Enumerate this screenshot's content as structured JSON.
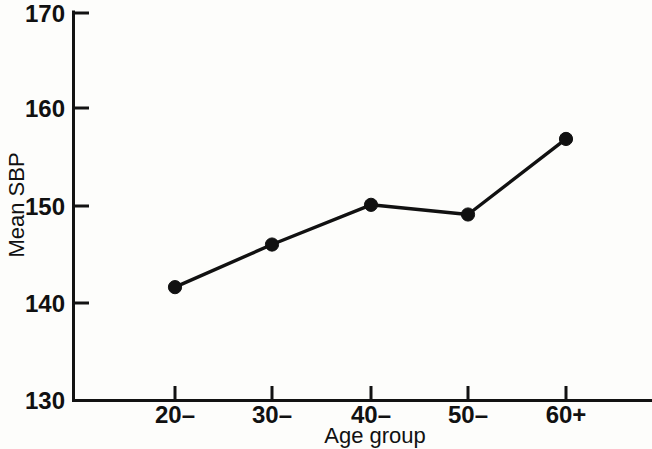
{
  "chart_data": {
    "type": "line",
    "title": "",
    "xlabel": "Age group",
    "ylabel": "Mean SBP",
    "categories": [
      "20–",
      "30–",
      "40–",
      "50–",
      "60+"
    ],
    "values": [
      141.7,
      146.1,
      150.2,
      149.2,
      157.0
    ],
    "series": [
      {
        "name": "Mean SBP",
        "values": [
          141.7,
          146.1,
          150.2,
          149.2,
          157.0
        ]
      }
    ],
    "ylim": [
      130,
      170
    ],
    "yticks": [
      130,
      140,
      150,
      160,
      170
    ],
    "ytick_labels": [
      "130",
      "140",
      "150",
      "160",
      "170"
    ],
    "xtick_labels": [
      "20–",
      "30–",
      "40–",
      "50–",
      "60+"
    ],
    "grid": false,
    "legend": "none",
    "marker": "filled-circle",
    "line_color": "#111111",
    "marker_color": "#111111",
    "background_color": "#fdfdfb",
    "axis_color": "#121212",
    "tick_direction": "in",
    "spines": [
      "left",
      "bottom"
    ]
  }
}
